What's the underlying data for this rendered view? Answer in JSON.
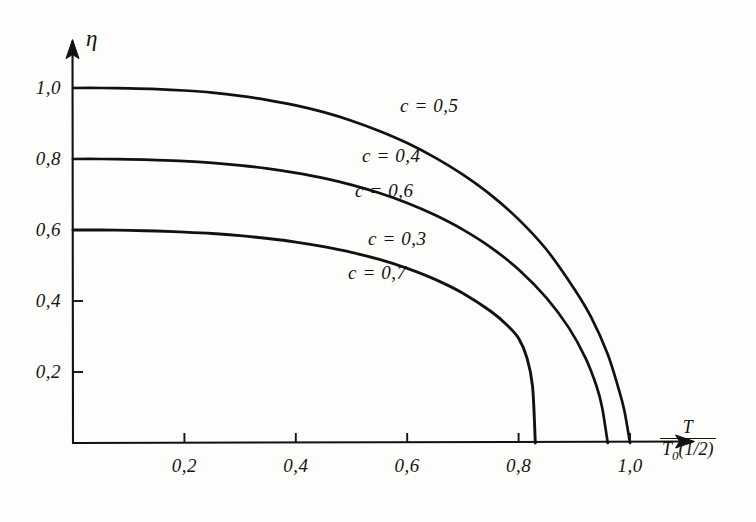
{
  "figure": {
    "background_color": "#fdfdfb",
    "ink_color": "#111111"
  },
  "axes": {
    "y_title": "η",
    "x_title_numerator": "T",
    "x_title_denominator_base": "T",
    "x_title_denominator_sub": "0",
    "x_title_denominator_tail": "(1/2)"
  },
  "chart_data": {
    "type": "line",
    "title": "",
    "subtitle": "",
    "xlabel": "T / T0(1/2)",
    "ylabel": "η",
    "xlim": [
      0.0,
      1.08
    ],
    "ylim": [
      0.0,
      1.08
    ],
    "grid": false,
    "legend_position": "inline-curve-labels",
    "xticks": [
      0.2,
      0.4,
      0.6,
      0.8,
      1.0
    ],
    "xtick_labels": [
      "0,2",
      "0,4",
      "0,6",
      "0,8",
      "1,0"
    ],
    "yticks": [
      0.2,
      0.4,
      0.6,
      0.8,
      1.0
    ],
    "ytick_labels": [
      "0,2",
      "0,4",
      "0,6",
      "0,8",
      "1,0"
    ],
    "series": [
      {
        "name": "c = 0.5",
        "labels": [
          "c = 0,5"
        ],
        "eta_zero": 1.0,
        "t_critical": 1.0,
        "x": [
          0.0,
          0.05,
          0.1,
          0.15,
          0.2,
          0.25,
          0.3,
          0.35,
          0.4,
          0.45,
          0.5,
          0.55,
          0.6,
          0.65,
          0.7,
          0.75,
          0.8,
          0.85,
          0.9,
          0.93,
          0.96,
          0.98,
          0.99,
          1.0
        ],
        "y": [
          1.0,
          1.0,
          0.999,
          0.997,
          0.993,
          0.987,
          0.978,
          0.966,
          0.951,
          0.932,
          0.908,
          0.879,
          0.845,
          0.804,
          0.756,
          0.699,
          0.63,
          0.545,
          0.434,
          0.355,
          0.25,
          0.15,
          0.09,
          0.0
        ]
      },
      {
        "name": "c = 0.4 / c = 0.6",
        "labels": [
          "c = 0,4",
          "c = 0,6"
        ],
        "eta_zero": 0.8,
        "t_critical": 0.96,
        "x": [
          0.0,
          0.05,
          0.1,
          0.15,
          0.2,
          0.25,
          0.3,
          0.35,
          0.4,
          0.45,
          0.5,
          0.55,
          0.6,
          0.65,
          0.7,
          0.75,
          0.8,
          0.85,
          0.89,
          0.92,
          0.94,
          0.95,
          0.96
        ],
        "y": [
          0.8,
          0.8,
          0.799,
          0.797,
          0.794,
          0.789,
          0.782,
          0.773,
          0.761,
          0.746,
          0.727,
          0.704,
          0.676,
          0.642,
          0.601,
          0.551,
          0.489,
          0.409,
          0.325,
          0.24,
          0.16,
          0.1,
          0.0
        ]
      },
      {
        "name": "c = 0.3 / c = 0.7",
        "labels": [
          "c = 0,3",
          "c = 0,7"
        ],
        "eta_zero": 0.6,
        "t_critical": 0.83,
        "x": [
          0.0,
          0.05,
          0.1,
          0.15,
          0.2,
          0.25,
          0.3,
          0.35,
          0.4,
          0.45,
          0.5,
          0.55,
          0.6,
          0.65,
          0.7,
          0.75,
          0.78,
          0.8,
          0.815,
          0.825,
          0.83
        ],
        "y": [
          0.6,
          0.6,
          0.599,
          0.597,
          0.594,
          0.59,
          0.584,
          0.576,
          0.566,
          0.553,
          0.537,
          0.517,
          0.492,
          0.461,
          0.422,
          0.371,
          0.331,
          0.295,
          0.24,
          0.16,
          0.0
        ]
      }
    ],
    "curve_labels": [
      {
        "text": "c = 0,5",
        "x_px": 400,
        "y_px": 95
      },
      {
        "text": "c = 0,4",
        "x_px": 362,
        "y_px": 145
      },
      {
        "text": "c = 0,6",
        "x_px": 355,
        "y_px": 180
      },
      {
        "text": "c = 0,3",
        "x_px": 368,
        "y_px": 228
      },
      {
        "text": "c = 0,7",
        "x_px": 348,
        "y_px": 262
      }
    ]
  }
}
